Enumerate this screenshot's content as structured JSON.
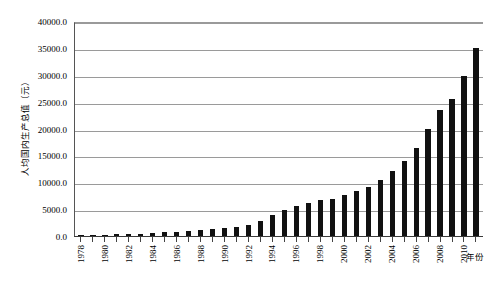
{
  "chart_data": {
    "type": "bar",
    "title": "",
    "xlabel": "年份",
    "ylabel": "人均国内生产总值（元）",
    "ylim": [
      0,
      40000
    ],
    "ytick_labels": [
      "40000.0",
      "35000.0",
      "30000.0",
      "25000.0",
      "20000.0",
      "15000.0",
      "10000.0",
      "5000.0",
      "0.0"
    ],
    "ytick_values": [
      40000,
      35000,
      30000,
      25000,
      20000,
      15000,
      10000,
      5000,
      0
    ],
    "grid": true,
    "legend": "none",
    "bar_color": "#111111",
    "xtick_label_step": 2,
    "categories": [
      1978,
      1979,
      1980,
      1981,
      1982,
      1983,
      1984,
      1985,
      1986,
      1987,
      1988,
      1989,
      1990,
      1991,
      1992,
      1993,
      1994,
      1995,
      1996,
      1997,
      1998,
      1999,
      2000,
      2001,
      2002,
      2003,
      2004,
      2005,
      2006,
      2007,
      2008,
      2009,
      2010,
      2011
    ],
    "xtick_labels": [
      "1978",
      "",
      "1980",
      "",
      "1982",
      "",
      "1984",
      "",
      "1986",
      "",
      "1988",
      "",
      "1990",
      "",
      "1992",
      "",
      "1994",
      "",
      "1996",
      "",
      "1998",
      "",
      "2000",
      "",
      "2002",
      "",
      "2004",
      "",
      "2006",
      "",
      "2008",
      "",
      "2010",
      ""
    ],
    "values": [
      385,
      423,
      468,
      498,
      533,
      583,
      695,
      858,
      963,
      1112,
      1366,
      1519,
      1644,
      1893,
      2311,
      2998,
      4044,
      5046,
      5846,
      6420,
      6796,
      7159,
      7858,
      8622,
      9398,
      10542,
      12336,
      14185,
      16500,
      20169,
      23708,
      25608,
      30015,
      35198
    ]
  }
}
